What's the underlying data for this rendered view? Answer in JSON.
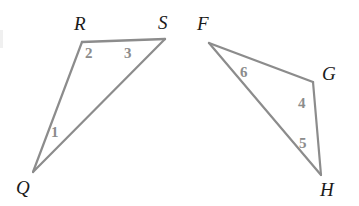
{
  "diagram": {
    "canvas": {
      "width": 359,
      "height": 206
    },
    "stroke_color": "#8c8c8c",
    "label_color": "#1a1a1a",
    "angle_label_color": "#8c8c8c",
    "background_color": "#ffffff",
    "stroke_width": 2.2,
    "figures": [
      {
        "name": "triangle-qrs",
        "vertices": [
          "Q",
          "R",
          "S"
        ],
        "points": {
          "Q": [
            33,
            172
          ],
          "R": [
            82,
            42
          ],
          "S": [
            165,
            39
          ]
        },
        "edges": [
          {
            "from": "R",
            "to": "S"
          },
          {
            "from": "R",
            "to": "Q"
          },
          {
            "from": "Q",
            "to": "S"
          }
        ]
      },
      {
        "name": "triangle-fgh",
        "vertices": [
          "F",
          "G",
          "H"
        ],
        "points": {
          "F": [
            209,
            43
          ],
          "G": [
            313,
            82
          ],
          "H": [
            321,
            175
          ]
        },
        "edges": [
          {
            "from": "F",
            "to": "G"
          },
          {
            "from": "G",
            "to": "H"
          },
          {
            "from": "F",
            "to": "H"
          }
        ]
      }
    ],
    "vertex_labels": [
      {
        "id": "R",
        "text": "R",
        "x": 74,
        "y": 14
      },
      {
        "id": "S",
        "text": "S",
        "x": 158,
        "y": 13
      },
      {
        "id": "Q",
        "text": "Q",
        "x": 16,
        "y": 178
      },
      {
        "id": "F",
        "text": "F",
        "x": 197,
        "y": 14
      },
      {
        "id": "G",
        "text": "G",
        "x": 322,
        "y": 64
      },
      {
        "id": "H",
        "text": "H",
        "x": 320,
        "y": 180
      }
    ],
    "angle_labels": [
      {
        "id": "1",
        "text": "1",
        "x": 51,
        "y": 125,
        "at_vertex": "Q"
      },
      {
        "id": "2",
        "text": "2",
        "x": 85,
        "y": 46,
        "at_vertex": "R"
      },
      {
        "id": "3",
        "text": "3",
        "x": 124,
        "y": 46,
        "at_vertex": "S"
      },
      {
        "id": "4",
        "text": "4",
        "x": 298,
        "y": 96,
        "at_vertex": "G"
      },
      {
        "id": "5",
        "text": "5",
        "x": 299,
        "y": 136,
        "at_vertex": "H"
      },
      {
        "id": "6",
        "text": "6",
        "x": 240,
        "y": 65,
        "at_vertex": "F"
      }
    ]
  }
}
